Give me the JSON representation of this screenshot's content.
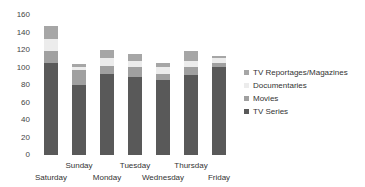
{
  "chart_data": {
    "type": "bar",
    "stacked": true,
    "title": "",
    "xlabel": "",
    "ylabel": "",
    "ylim": [
      0,
      160
    ],
    "yticks": [
      0,
      20,
      40,
      60,
      80,
      100,
      120,
      140,
      160
    ],
    "grid": false,
    "legend_position": "right",
    "categories": [
      "Saturday",
      "Sunday",
      "Monday",
      "Tuesday",
      "Wednesday",
      "Thursday",
      "Friday"
    ],
    "series": [
      {
        "name": "TV Series",
        "color": "#595959",
        "values": [
          105,
          80,
          93,
          89,
          86,
          91,
          101
        ]
      },
      {
        "name": "Movies",
        "color": "#a0a0a0",
        "values": [
          14,
          17,
          9,
          12,
          7,
          10,
          4
        ]
      },
      {
        "name": "Documentaries",
        "color": "#ececec",
        "values": [
          14,
          4,
          9,
          6,
          8,
          7,
          6
        ]
      },
      {
        "name": "TV Reportages/Magazines",
        "color": "#a6a6a6",
        "values": [
          15,
          3,
          9,
          9,
          4,
          11,
          2
        ]
      }
    ],
    "legend_order": [
      "TV Reportages/Magazines",
      "Documentaries",
      "Movies",
      "TV Series"
    ]
  }
}
